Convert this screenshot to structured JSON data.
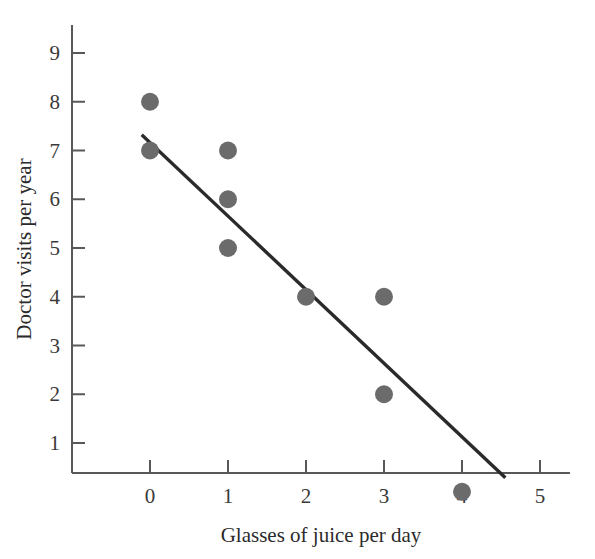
{
  "chart_data": {
    "type": "scatter",
    "title": "",
    "xlabel": "Glasses of juice per day",
    "ylabel": "Doctor visits per year",
    "xlim": [
      -0.35,
      5.4
    ],
    "ylim": [
      -0.35,
      9.6
    ],
    "xticks": [
      "0",
      "1",
      "2",
      "3",
      "4",
      "5"
    ],
    "xtick_values": [
      0,
      1,
      2,
      3,
      4,
      5
    ],
    "yticks": [
      "1",
      "2",
      "3",
      "4",
      "5",
      "6",
      "7",
      "8",
      "9"
    ],
    "ytick_values": [
      1,
      2,
      3,
      4,
      5,
      6,
      7,
      8,
      9
    ],
    "grid": false,
    "legend": "none",
    "points": [
      {
        "x": 0,
        "y": 8
      },
      {
        "x": 0,
        "y": 7
      },
      {
        "x": 1,
        "y": 7
      },
      {
        "x": 1,
        "y": 6
      },
      {
        "x": 1,
        "y": 5
      },
      {
        "x": 2,
        "y": 4
      },
      {
        "x": 3,
        "y": 4
      },
      {
        "x": 3,
        "y": 2
      },
      {
        "x": 4,
        "y": 0
      }
    ],
    "trend_line": {
      "x1": -0.09,
      "y1": 7.3,
      "x2": 4.54,
      "y2": 0.31
    },
    "marker_color": "#6b6b6b",
    "marker_radius": 9,
    "line_color": "#2a2a2a",
    "line_width": 3.4,
    "axis_color": "#585858"
  }
}
